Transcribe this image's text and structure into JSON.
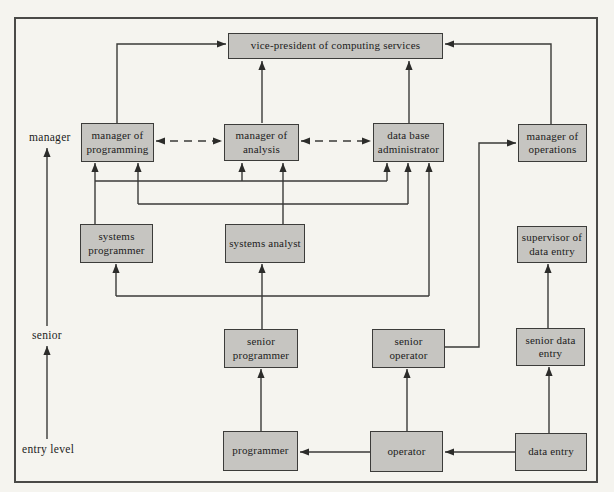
{
  "figure_type": "organization-career-path-diagram",
  "colors": {
    "page_bg": "#f5f4ef",
    "box_fill": "#c6c5c1",
    "box_border": "#3c3c3a",
    "line": "#3a3a38",
    "text": "#1c1c1c"
  },
  "axis": {
    "manager": "manager",
    "senior": "senior",
    "entry": "entry level"
  },
  "boxes": {
    "vp": "vice-president of computing services",
    "mgr_programming": "manager of programming",
    "mgr_analysis": "manager of analysis",
    "dba": "data base administrator",
    "mgr_operations": "manager of operations",
    "sys_programmer": "systems programmer",
    "sys_analyst": "systems analyst",
    "sup_data_entry": "supervisor of data entry",
    "sr_programmer": "senior programmer",
    "sr_operator": "senior operator",
    "sr_data_entry": "senior data entry",
    "programmer": "programmer",
    "operator": "operator",
    "data_entry": "data entry"
  },
  "edges": [
    {
      "from": "manager_of_programming",
      "to": "vice_president",
      "style": "solid"
    },
    {
      "from": "manager_of_analysis",
      "to": "vice_president",
      "style": "solid"
    },
    {
      "from": "data_base_administrator",
      "to": "vice_president",
      "style": "solid"
    },
    {
      "from": "manager_of_operations",
      "to": "vice_president",
      "style": "solid"
    },
    {
      "from": "manager_of_programming",
      "to": "manager_of_analysis",
      "style": "dashed-bidirectional"
    },
    {
      "from": "manager_of_analysis",
      "to": "data_base_administrator",
      "style": "dashed-bidirectional"
    },
    {
      "from": "systems_programmer",
      "to": "manager_of_programming",
      "style": "solid"
    },
    {
      "from": "systems_programmer",
      "to": "manager_of_analysis",
      "style": "solid"
    },
    {
      "from": "systems_programmer",
      "to": "data_base_administrator",
      "style": "solid"
    },
    {
      "from": "systems_analyst",
      "to": "manager_of_programming",
      "style": "solid"
    },
    {
      "from": "systems_analyst",
      "to": "manager_of_analysis",
      "style": "solid"
    },
    {
      "from": "systems_analyst",
      "to": "data_base_administrator",
      "style": "solid"
    },
    {
      "from": "senior_programmer",
      "to": "systems_programmer",
      "style": "solid"
    },
    {
      "from": "senior_programmer",
      "to": "systems_analyst",
      "style": "solid"
    },
    {
      "from": "senior_programmer",
      "to": "data_base_administrator",
      "style": "solid"
    },
    {
      "from": "senior_operator",
      "to": "manager_of_operations",
      "style": "solid"
    },
    {
      "from": "senior_data_entry",
      "to": "supervisor_of_data_entry",
      "style": "solid"
    },
    {
      "from": "programmer",
      "to": "senior_programmer",
      "style": "solid"
    },
    {
      "from": "operator",
      "to": "senior_operator",
      "style": "solid"
    },
    {
      "from": "operator",
      "to": "programmer",
      "style": "solid"
    },
    {
      "from": "data_entry",
      "to": "senior_data_entry",
      "style": "solid"
    },
    {
      "from": "data_entry",
      "to": "operator",
      "style": "solid"
    },
    {
      "from": "entry_level",
      "to": "senior",
      "style": "solid-axis"
    },
    {
      "from": "senior",
      "to": "manager",
      "style": "solid-axis"
    }
  ]
}
